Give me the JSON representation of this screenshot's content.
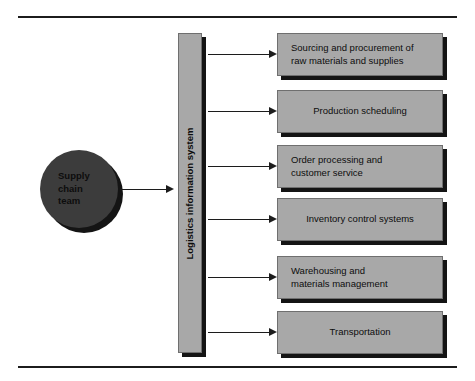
{
  "figure": {
    "source_node": {
      "label": "Supply chain team",
      "lines": [
        "Supply",
        "chain",
        "team"
      ],
      "shape": "circle",
      "fill": "#3c3c3c"
    },
    "hub": {
      "label": "Logistics information system",
      "shape": "vertical-bar",
      "fill": "#a8a8a8",
      "orientation": "vertical"
    },
    "outputs": [
      {
        "label": "Sourcing and procurement of raw materials and supplies",
        "lines": [
          "Sourcing and procurement of",
          "raw materials and supplies"
        ],
        "align": "left"
      },
      {
        "label": "Production scheduling",
        "lines": [
          "Production scheduling"
        ],
        "align": "center"
      },
      {
        "label": "Order processing and customer service",
        "lines": [
          "Order processing and",
          "customer service"
        ],
        "align": "left"
      },
      {
        "label": "Inventory control systems",
        "lines": [
          "Inventory control systems"
        ],
        "align": "center"
      },
      {
        "label": "Warehousing and materials management",
        "lines": [
          "Warehousing and",
          "materials management"
        ],
        "align": "left"
      },
      {
        "label": "Transportation",
        "lines": [
          "Transportation"
        ],
        "align": "center"
      }
    ],
    "colors": {
      "box_fill": "#a8a8a8",
      "box_border": "#6f6f6f",
      "shadow": "#141414",
      "circle_fill": "#3c3c3c",
      "line": "#1c1c1c",
      "text": "#0d0d0d",
      "background": "#ffffff"
    }
  }
}
